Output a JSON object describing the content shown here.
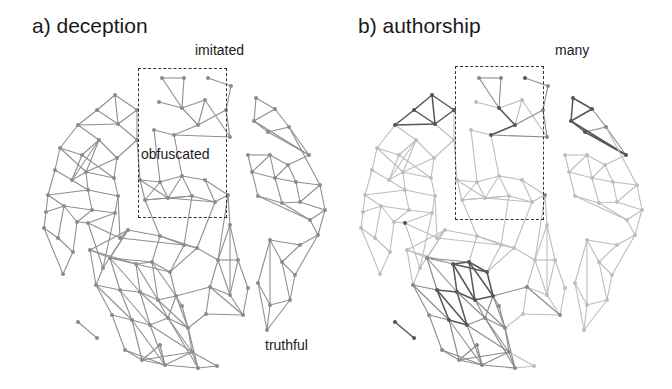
{
  "panels": [
    {
      "id": "a",
      "title": "a) deception",
      "labels": [
        {
          "text": "imitated",
          "x": 195,
          "y": 48
        },
        {
          "text": "obfuscated",
          "x": 141,
          "y": 152
        },
        {
          "text": "truthful",
          "x": 265,
          "y": 343
        }
      ],
      "highlight_box": {
        "x": 138,
        "y": 68,
        "w": 89,
        "h": 150
      }
    },
    {
      "id": "b",
      "title": "b) authorship",
      "labels": [
        {
          "text": "many",
          "x": 255,
          "y": 48
        }
      ],
      "highlight_box": {
        "x": 138,
        "y": 66,
        "w": 89,
        "h": 154
      }
    }
  ],
  "graph": {
    "node_color_a": "#8c8c8c",
    "edge_color_a": "#8f8f8f",
    "shades_b": {
      "dark": "#555555",
      "mid": "#8a8a8a",
      "light": "#bdbdbd"
    },
    "nodes": [
      [
        162,
        78,
        "mid"
      ],
      [
        184,
        78,
        "mid"
      ],
      [
        208,
        78,
        "dark"
      ],
      [
        231,
        86,
        "mid"
      ],
      [
        159,
        102,
        "light"
      ],
      [
        182,
        108,
        "dark"
      ],
      [
        205,
        100,
        "light"
      ],
      [
        226,
        110,
        "mid"
      ],
      [
        198,
        125,
        "dark"
      ],
      [
        174,
        135,
        "dark"
      ],
      [
        154,
        130,
        "light"
      ],
      [
        230,
        137,
        "mid"
      ],
      [
        256,
        98,
        "dark"
      ],
      [
        275,
        109,
        "dark"
      ],
      [
        254,
        121,
        "dark"
      ],
      [
        268,
        132,
        "dark"
      ],
      [
        289,
        127,
        "mid"
      ],
      [
        309,
        155,
        "dark"
      ],
      [
        115,
        95,
        "dark"
      ],
      [
        97,
        110,
        "dark"
      ],
      [
        78,
        125,
        "dark"
      ],
      [
        118,
        124,
        "dark"
      ],
      [
        137,
        110,
        "dark"
      ],
      [
        137,
        140,
        "light"
      ],
      [
        60,
        148,
        "light"
      ],
      [
        82,
        155,
        "light"
      ],
      [
        99,
        140,
        "light"
      ],
      [
        117,
        158,
        "light"
      ],
      [
        55,
        170,
        "light"
      ],
      [
        72,
        180,
        "light"
      ],
      [
        86,
        172,
        "light"
      ],
      [
        114,
        178,
        "light"
      ],
      [
        48,
        195,
        "light"
      ],
      [
        88,
        190,
        "light"
      ],
      [
        118,
        196,
        "light"
      ],
      [
        46,
        212,
        "light"
      ],
      [
        64,
        206,
        "light"
      ],
      [
        77,
        222,
        "light"
      ],
      [
        92,
        210,
        "light"
      ],
      [
        115,
        213,
        "light"
      ],
      [
        44,
        228,
        "light"
      ],
      [
        58,
        238,
        "light"
      ],
      [
        73,
        252,
        "light"
      ],
      [
        63,
        274,
        "light"
      ],
      [
        88,
        223,
        "dark"
      ],
      [
        140,
        180,
        "light"
      ],
      [
        160,
        182,
        "light"
      ],
      [
        182,
        176,
        "light"
      ],
      [
        205,
        180,
        "light"
      ],
      [
        145,
        200,
        "light"
      ],
      [
        168,
        198,
        "light"
      ],
      [
        192,
        196,
        "light"
      ],
      [
        215,
        202,
        "light"
      ],
      [
        228,
        195,
        "mid"
      ],
      [
        248,
        155,
        "light"
      ],
      [
        270,
        155,
        "light"
      ],
      [
        288,
        165,
        "light"
      ],
      [
        252,
        172,
        "light"
      ],
      [
        275,
        178,
        "light"
      ],
      [
        296,
        182,
        "light"
      ],
      [
        258,
        196,
        "light"
      ],
      [
        282,
        203,
        "light"
      ],
      [
        300,
        202,
        "light"
      ],
      [
        320,
        185,
        "light"
      ],
      [
        310,
        220,
        "light"
      ],
      [
        325,
        210,
        "light"
      ],
      [
        318,
        235,
        "light"
      ],
      [
        300,
        245,
        "light"
      ],
      [
        270,
        240,
        "light"
      ],
      [
        282,
        262,
        "light"
      ],
      [
        295,
        275,
        "light"
      ],
      [
        258,
        283,
        "light"
      ],
      [
        270,
        305,
        "light"
      ],
      [
        290,
        300,
        "light"
      ],
      [
        267,
        330,
        "light"
      ],
      [
        230,
        225,
        "light"
      ],
      [
        238,
        260,
        "light"
      ],
      [
        248,
        288,
        "light"
      ],
      [
        243,
        315,
        "mid"
      ],
      [
        230,
        295,
        "light"
      ],
      [
        218,
        260,
        "light"
      ],
      [
        210,
        287,
        "mid"
      ],
      [
        206,
        314,
        "light"
      ],
      [
        197,
        248,
        "light"
      ],
      [
        160,
        236,
        "light"
      ],
      [
        184,
        245,
        "light"
      ],
      [
        128,
        230,
        "light"
      ],
      [
        90,
        250,
        "light"
      ],
      [
        110,
        258,
        "mid"
      ],
      [
        136,
        264,
        "dark"
      ],
      [
        152,
        262,
        "dark"
      ],
      [
        170,
        272,
        "dark"
      ],
      [
        96,
        285,
        "mid"
      ],
      [
        120,
        290,
        "dark"
      ],
      [
        140,
        292,
        "dark"
      ],
      [
        158,
        300,
        "dark"
      ],
      [
        176,
        296,
        "dark"
      ],
      [
        112,
        315,
        "mid"
      ],
      [
        132,
        320,
        "dark"
      ],
      [
        150,
        325,
        "dark"
      ],
      [
        168,
        318,
        "mid"
      ],
      [
        188,
        328,
        "mid"
      ],
      [
        125,
        350,
        "mid"
      ],
      [
        142,
        360,
        "mid"
      ],
      [
        165,
        365,
        "mid"
      ],
      [
        192,
        352,
        "mid"
      ],
      [
        198,
        368,
        "mid"
      ],
      [
        78,
        322,
        "dark"
      ],
      [
        97,
        338,
        "dark"
      ],
      [
        217,
        366,
        "light"
      ],
      [
        182,
        306,
        "mid"
      ],
      [
        160,
        345,
        "mid"
      ],
      [
        103,
        268,
        "light"
      ],
      [
        120,
        238,
        "light"
      ]
    ],
    "edges": [
      [
        0,
        1
      ],
      [
        1,
        5
      ],
      [
        0,
        5
      ],
      [
        5,
        4
      ],
      [
        2,
        3
      ],
      [
        5,
        8
      ],
      [
        8,
        9
      ],
      [
        9,
        10
      ],
      [
        8,
        6
      ],
      [
        6,
        11
      ],
      [
        7,
        11
      ],
      [
        8,
        7
      ],
      [
        5,
        6
      ],
      [
        3,
        7
      ],
      [
        9,
        11
      ],
      [
        12,
        13
      ],
      [
        13,
        14
      ],
      [
        14,
        15
      ],
      [
        15,
        16
      ],
      [
        12,
        14
      ],
      [
        16,
        17
      ],
      [
        15,
        17
      ],
      [
        13,
        16
      ],
      [
        14,
        17
      ],
      [
        18,
        19
      ],
      [
        19,
        20
      ],
      [
        18,
        21
      ],
      [
        21,
        22
      ],
      [
        20,
        21
      ],
      [
        22,
        23
      ],
      [
        21,
        23
      ],
      [
        18,
        22
      ],
      [
        19,
        21
      ],
      [
        24,
        25
      ],
      [
        25,
        26
      ],
      [
        26,
        27
      ],
      [
        24,
        28
      ],
      [
        25,
        29
      ],
      [
        26,
        30
      ],
      [
        27,
        31
      ],
      [
        28,
        29
      ],
      [
        29,
        30
      ],
      [
        30,
        31
      ],
      [
        24,
        30
      ],
      [
        25,
        31
      ],
      [
        26,
        29
      ],
      [
        27,
        30
      ],
      [
        28,
        32
      ],
      [
        29,
        33
      ],
      [
        31,
        34
      ],
      [
        30,
        33
      ],
      [
        32,
        33
      ],
      [
        33,
        34
      ],
      [
        20,
        24
      ],
      [
        20,
        26
      ],
      [
        23,
        27
      ],
      [
        32,
        35
      ],
      [
        35,
        36
      ],
      [
        36,
        37
      ],
      [
        37,
        38
      ],
      [
        38,
        39
      ],
      [
        35,
        40
      ],
      [
        40,
        41
      ],
      [
        41,
        42
      ],
      [
        42,
        43
      ],
      [
        36,
        41
      ],
      [
        37,
        42
      ],
      [
        36,
        38
      ],
      [
        34,
        39
      ],
      [
        33,
        38
      ],
      [
        39,
        44
      ],
      [
        44,
        37
      ],
      [
        40,
        43
      ],
      [
        32,
        36
      ],
      [
        45,
        46
      ],
      [
        46,
        47
      ],
      [
        47,
        48
      ],
      [
        45,
        49
      ],
      [
        49,
        50
      ],
      [
        50,
        51
      ],
      [
        51,
        52
      ],
      [
        52,
        53
      ],
      [
        46,
        50
      ],
      [
        47,
        51
      ],
      [
        48,
        52
      ],
      [
        45,
        50
      ],
      [
        46,
        49
      ],
      [
        47,
        50
      ],
      [
        48,
        53
      ],
      [
        49,
        51
      ],
      [
        50,
        52
      ],
      [
        10,
        46
      ],
      [
        23,
        45
      ],
      [
        9,
        47
      ],
      [
        54,
        55
      ],
      [
        55,
        56
      ],
      [
        54,
        57
      ],
      [
        57,
        58
      ],
      [
        58,
        59
      ],
      [
        56,
        59
      ],
      [
        55,
        57
      ],
      [
        55,
        58
      ],
      [
        56,
        58
      ],
      [
        57,
        60
      ],
      [
        58,
        61
      ],
      [
        60,
        61
      ],
      [
        61,
        62
      ],
      [
        59,
        62
      ],
      [
        59,
        63
      ],
      [
        62,
        63
      ],
      [
        17,
        56
      ],
      [
        16,
        63
      ],
      [
        60,
        64
      ],
      [
        61,
        64
      ],
      [
        62,
        65
      ],
      [
        63,
        65
      ],
      [
        64,
        65
      ],
      [
        64,
        66
      ],
      [
        65,
        66
      ],
      [
        66,
        67
      ],
      [
        67,
        68
      ],
      [
        68,
        69
      ],
      [
        69,
        70
      ],
      [
        67,
        69
      ],
      [
        68,
        71
      ],
      [
        71,
        72
      ],
      [
        72,
        73
      ],
      [
        71,
        74
      ],
      [
        72,
        74
      ],
      [
        73,
        74
      ],
      [
        69,
        73
      ],
      [
        70,
        73
      ],
      [
        66,
        70
      ],
      [
        68,
        72
      ],
      [
        75,
        76
      ],
      [
        76,
        77
      ],
      [
        77,
        78
      ],
      [
        78,
        79
      ],
      [
        75,
        79
      ],
      [
        76,
        79
      ],
      [
        79,
        80
      ],
      [
        80,
        81
      ],
      [
        81,
        82
      ],
      [
        80,
        76
      ],
      [
        82,
        78
      ],
      [
        81,
        79
      ],
      [
        75,
        80
      ],
      [
        53,
        75
      ],
      [
        53,
        80
      ],
      [
        83,
        84
      ],
      [
        84,
        85
      ],
      [
        85,
        83
      ],
      [
        83,
        80
      ],
      [
        84,
        86
      ],
      [
        86,
        87
      ],
      [
        87,
        88
      ],
      [
        88,
        89
      ],
      [
        89,
        90
      ],
      [
        90,
        91
      ],
      [
        86,
        88
      ],
      [
        87,
        89
      ],
      [
        84,
        90
      ],
      [
        85,
        91
      ],
      [
        83,
        91
      ],
      [
        88,
        90
      ],
      [
        89,
        91
      ],
      [
        87,
        92
      ],
      [
        92,
        93
      ],
      [
        93,
        94
      ],
      [
        94,
        95
      ],
      [
        95,
        96
      ],
      [
        88,
        93
      ],
      [
        89,
        94
      ],
      [
        90,
        95
      ],
      [
        91,
        96
      ],
      [
        88,
        94
      ],
      [
        89,
        95
      ],
      [
        90,
        96
      ],
      [
        92,
        97
      ],
      [
        93,
        98
      ],
      [
        94,
        99
      ],
      [
        95,
        100
      ],
      [
        96,
        101
      ],
      [
        97,
        98
      ],
      [
        98,
        99
      ],
      [
        99,
        100
      ],
      [
        100,
        101
      ],
      [
        93,
        99
      ],
      [
        94,
        100
      ],
      [
        95,
        101
      ],
      [
        92,
        98
      ],
      [
        96,
        100
      ],
      [
        97,
        102
      ],
      [
        98,
        103
      ],
      [
        99,
        104
      ],
      [
        100,
        105
      ],
      [
        101,
        106
      ],
      [
        102,
        103
      ],
      [
        103,
        104
      ],
      [
        104,
        105
      ],
      [
        105,
        106
      ],
      [
        102,
        104
      ],
      [
        103,
        105
      ],
      [
        104,
        106
      ],
      [
        98,
        104
      ],
      [
        99,
        105
      ],
      [
        100,
        106
      ],
      [
        101,
        105
      ],
      [
        107,
        108
      ],
      [
        106,
        109
      ],
      [
        105,
        109
      ],
      [
        110,
        96
      ],
      [
        110,
        101
      ],
      [
        111,
        103
      ],
      [
        111,
        104
      ],
      [
        112,
        86
      ],
      [
        112,
        92
      ],
      [
        113,
        86
      ],
      [
        113,
        44
      ],
      [
        85,
        113
      ],
      [
        81,
        96
      ],
      [
        82,
        101
      ],
      [
        78,
        81
      ],
      [
        49,
        84
      ],
      [
        51,
        85
      ],
      [
        52,
        83
      ],
      [
        34,
        113
      ],
      [
        39,
        112
      ],
      [
        44,
        112
      ]
    ]
  }
}
